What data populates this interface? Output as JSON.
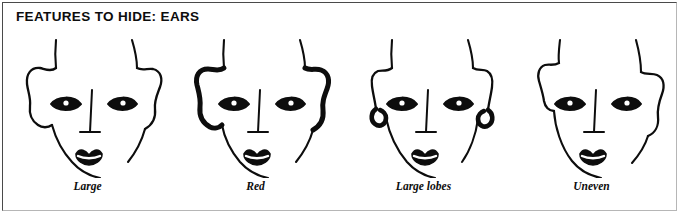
{
  "panel": {
    "title": "FEATURES TO HIDE: EARS",
    "border_color_dark": "#4a4a4a",
    "border_color_light": "#b6b6b6",
    "background_color": "#ffffff",
    "ink_color": "#0d0d0d"
  },
  "figure": {
    "type": "line-art-illustration",
    "item_count": 4
  },
  "faces": [
    {
      "index": 1,
      "caption": "Large",
      "ear_variation": "large",
      "description": "Front view face with oversized ears on both sides"
    },
    {
      "index": 2,
      "caption": "Red",
      "ear_variation": "red",
      "description": "Front view face with heavily inked thick ears indicating redness"
    },
    {
      "index": 3,
      "caption": "Large lobes",
      "ear_variation": "large-lobes",
      "description": "Front view face with narrow ears ending in thick heavy lobes"
    },
    {
      "index": 4,
      "caption": "Uneven",
      "ear_variation": "uneven",
      "description": "Front view face with ears set at different heights"
    }
  ]
}
